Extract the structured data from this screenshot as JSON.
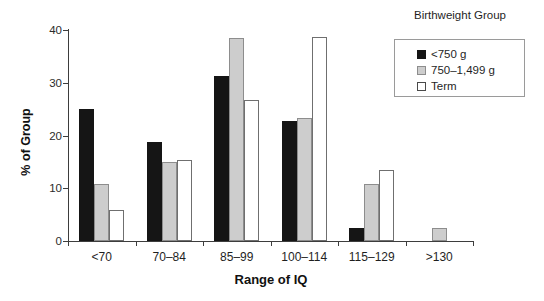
{
  "chart_data": {
    "type": "bar",
    "title": "",
    "xlabel": "Range of IQ",
    "ylabel": "% of Group",
    "categories": [
      "<70",
      "70–84",
      "85–99",
      "100–114",
      "115–129",
      ">130"
    ],
    "series": [
      {
        "name": "<750 g",
        "values": [
          25.0,
          18.8,
          31.3,
          22.8,
          2.4,
          0
        ]
      },
      {
        "name": "750–1,499 g",
        "values": [
          10.9,
          15.0,
          38.4,
          23.4,
          10.9,
          2.5
        ]
      },
      {
        "name": "Term",
        "values": [
          5.8,
          15.3,
          26.8,
          38.7,
          13.5,
          0
        ]
      }
    ],
    "ylim": [
      0,
      40
    ],
    "yticks": [
      0,
      10,
      20,
      30,
      40
    ],
    "ytick_labels": [
      "0",
      "10",
      "20",
      "30",
      "40"
    ],
    "grid": false,
    "legend": {
      "title": "Birthweight Group",
      "position": "top-right",
      "entries": [
        "<750 g",
        "750–1,499 g",
        "Term"
      ]
    },
    "colors": {
      "series_0": "#151515",
      "series_1": "#cdcdcd",
      "series_2": "#ffffff",
      "axis": "#3d3d3d",
      "text": "#1f1f1f",
      "background": "#ffffff"
    }
  }
}
